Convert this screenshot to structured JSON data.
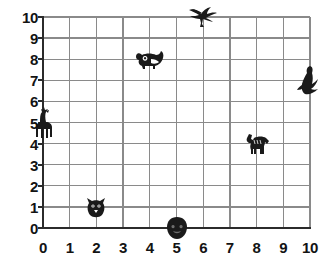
{
  "chart_data": {
    "type": "scatter",
    "title": "",
    "xlabel": "",
    "ylabel": "",
    "xlim": [
      0,
      10
    ],
    "ylim": [
      0,
      10
    ],
    "grid": true,
    "legend": "none",
    "x_ticks": [
      "0",
      "1",
      "2",
      "3",
      "4",
      "5",
      "6",
      "7",
      "8",
      "9",
      "10"
    ],
    "y_ticks": [
      "0",
      "1",
      "2",
      "3",
      "4",
      "5",
      "6",
      "7",
      "8",
      "9",
      "10"
    ],
    "x_tick_values": [
      0,
      1,
      2,
      3,
      4,
      5,
      6,
      7,
      8,
      9,
      10
    ],
    "y_tick_values": [
      0,
      1,
      2,
      3,
      4,
      5,
      6,
      7,
      8,
      9,
      10
    ],
    "points": [
      {
        "label": "bird",
        "icon": "bird-icon",
        "x": 6,
        "y": 10
      },
      {
        "label": "panda",
        "icon": "panda-icon",
        "x": 4,
        "y": 8
      },
      {
        "label": "seal",
        "icon": "seal-icon",
        "x": 10,
        "y": 7
      },
      {
        "label": "giraffe",
        "icon": "giraffe-icon",
        "x": 0,
        "y": 5
      },
      {
        "label": "zebra",
        "icon": "zebra-icon",
        "x": 8,
        "y": 4
      },
      {
        "label": "tiger",
        "icon": "tiger-icon",
        "x": 2,
        "y": 1
      },
      {
        "label": "gorilla",
        "icon": "gorilla-icon",
        "x": 5,
        "y": 0
      }
    ]
  },
  "style": {
    "background": "#ffffff",
    "grid_color": "#8a8a8a",
    "axis_color": "#2b2b2b",
    "label_color": "#131313",
    "marker_color": "#1a1a1a"
  },
  "geometry": {
    "plot_left": 43,
    "plot_top": 17,
    "plot_right": 310,
    "plot_bottom": 228
  }
}
